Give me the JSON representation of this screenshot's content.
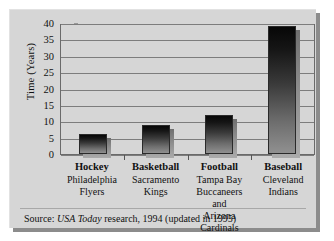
{
  "chart_data": {
    "type": "bar",
    "title": "",
    "xlabel": "",
    "ylabel": "Time (Years)",
    "ylim": [
      0,
      40
    ],
    "yticks": [
      0,
      5,
      10,
      15,
      20,
      25,
      30,
      35,
      40
    ],
    "grid": true,
    "legend": "none",
    "categories": [
      "Hockey",
      "Basketball",
      "Football",
      "Baseball"
    ],
    "category_sublabels": [
      "Philadelphia Flyers",
      "Sacramento Kings",
      "Tampa Bay Buccaneers and Arizona Cardinals",
      "Cleveland Indians"
    ],
    "values": [
      6,
      9,
      12,
      39
    ],
    "series": [
      {
        "name": "Time (Years)",
        "values": [
          6,
          9,
          12,
          39
        ]
      }
    ]
  },
  "axis": {
    "y_label": "Time (Years)",
    "y_ticks": [
      "40",
      "35",
      "30",
      "25",
      "20",
      "15",
      "10",
      "5",
      "0"
    ]
  },
  "categories": [
    {
      "sport": "Hockey",
      "team_line1": "Philadelphia",
      "team_line2": "Flyers",
      "team_line3": ""
    },
    {
      "sport": "Basketball",
      "team_line1": "Sacramento",
      "team_line2": "Kings",
      "team_line3": ""
    },
    {
      "sport": "Football",
      "team_line1": "Tampa Bay",
      "team_line2": "Buccaneers and",
      "team_line3": "Arizona Cardinals"
    },
    {
      "sport": "Baseball",
      "team_line1": "Cleveland",
      "team_line2": "Indians",
      "team_line3": ""
    }
  ],
  "source": {
    "prefix": "Source: ",
    "publication": "USA Today",
    "suffix": " research, 1994 (updated in 1995)"
  },
  "colors": {
    "panel_background": "#d6d6d6",
    "bar_top": "#070707",
    "bar_bottom": "#909090",
    "bar_shadow": "#8f8f8f",
    "gridline": "#7d7d7d",
    "frame": "#6a6a6a",
    "drop_shadow": "#8c8c8c",
    "text": "#111111"
  }
}
